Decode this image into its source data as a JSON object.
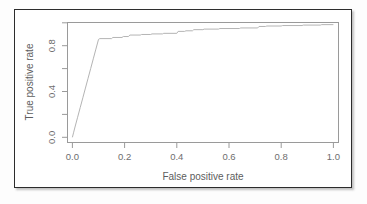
{
  "figure": {
    "background_color": "#ffffff",
    "border_color": "#2c2c2c",
    "frame_color": "#9a9a9a",
    "curve_color": "#b4b4b4",
    "label_color": "#6e6e6e"
  },
  "chart_data": {
    "type": "line",
    "title": "",
    "xlabel": "False positive rate",
    "ylabel": "True positive rate",
    "xlim": [
      0.0,
      1.0
    ],
    "ylim": [
      0.0,
      1.0
    ],
    "grid": false,
    "legend": "none",
    "xticks": [
      0.0,
      0.2,
      0.4,
      0.6,
      0.8,
      1.0
    ],
    "xtick_labels": [
      "0.0",
      "0.2",
      "0.4",
      "0.6",
      "0.8",
      "1.0"
    ],
    "yticks": [
      0.0,
      0.2,
      0.4,
      0.6,
      0.8,
      1.0
    ],
    "ytick_labels": [
      "0.0",
      "",
      "0.4",
      "",
      "0.8",
      ""
    ],
    "ytick_labels_shown": [
      "0.0",
      "0.4",
      "0.8"
    ],
    "series": [
      {
        "name": "ROC curve",
        "x": [
          0.0,
          0.005,
          0.01,
          0.02,
          0.03,
          0.04,
          0.05,
          0.06,
          0.07,
          0.08,
          0.09,
          0.1,
          0.105,
          0.15,
          0.155,
          0.19,
          0.195,
          0.215,
          0.22,
          0.26,
          0.265,
          0.3,
          0.305,
          0.345,
          0.35,
          0.4,
          0.405,
          0.43,
          0.435,
          0.46,
          0.465,
          0.5,
          0.505,
          0.56,
          0.565,
          0.64,
          0.645,
          0.71,
          0.715,
          0.74,
          0.745,
          0.8,
          0.805,
          0.88,
          0.885,
          0.95,
          0.955,
          1.0
        ],
        "y": [
          0.0,
          0.045,
          0.09,
          0.175,
          0.26,
          0.345,
          0.43,
          0.515,
          0.6,
          0.685,
          0.77,
          0.855,
          0.862,
          0.862,
          0.872,
          0.872,
          0.88,
          0.88,
          0.893,
          0.893,
          0.898,
          0.898,
          0.903,
          0.903,
          0.908,
          0.908,
          0.925,
          0.925,
          0.93,
          0.93,
          0.94,
          0.94,
          0.945,
          0.945,
          0.95,
          0.95,
          0.955,
          0.955,
          0.968,
          0.968,
          0.972,
          0.972,
          0.976,
          0.976,
          0.98,
          0.98,
          0.984,
          0.984
        ]
      }
    ]
  }
}
